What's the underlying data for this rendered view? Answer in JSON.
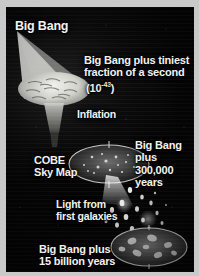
{
  "figure": {
    "background_color": "#070707",
    "border_color": "#c9c9c9",
    "text_color": "#f2f2f2"
  },
  "labels": {
    "big_bang": "Big Bang",
    "tiniest_fraction": "Big Bang plus tiniest\nfraction of a second",
    "exponent_base": "(10",
    "exponent_power": "-43",
    "exponent_close": ")",
    "inflation": "Inflation",
    "cobe_sky_map": "COBE\nSky Map",
    "bang_plus_300k": "Big Bang\nplus\n300,000\nyears",
    "light_first_galaxies": "Light from\nfirst galaxies",
    "bang_plus_15b": "Big Bang plus\n15 billion years"
  },
  "stages": [
    {
      "name": "big-bang-singularity",
      "time": "0",
      "description": "Point of origin at upper left"
    },
    {
      "name": "inflation-cone",
      "time": "10^-43 s",
      "description": "Flaring cone of inflation"
    },
    {
      "name": "cobe-sky-map",
      "time": "300,000 years",
      "description": "Speckled microwave background ellipse"
    },
    {
      "name": "first-galaxies",
      "time": "after 300,000 years",
      "description": "Scattered points of light"
    },
    {
      "name": "present-universe",
      "time": "15 billion years",
      "description": "Ellipse of galaxies"
    }
  ],
  "icons": {
    "inflation_cone": "cone-icon",
    "cobe_ellipse": "ellipse-icon",
    "galaxy_ellipse": "galaxy-icon",
    "starfield": "stars-icon"
  }
}
